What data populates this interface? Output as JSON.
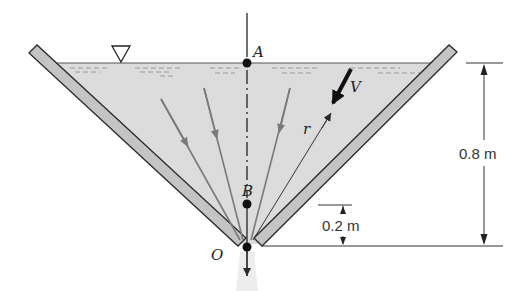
{
  "figure": {
    "type": "conical tank draining through bottom orifice",
    "colors": {
      "water": "#dcdcdc",
      "plate_fill": "#c4c4c4",
      "outline": "#2a2a2a",
      "streamline": "#7a7a7a",
      "jet": "#ececec"
    },
    "points": [
      {
        "label": "A",
        "description": "free surface on centerline"
      },
      {
        "label": "B",
        "description": "point on centerline 0.2 m above O"
      },
      {
        "label": "O",
        "description": "apex / outlet"
      }
    ],
    "labels": {
      "point_a": "A",
      "point_b": "B",
      "point_o": "O",
      "velocity": "V",
      "radius": "r"
    },
    "dimensions": {
      "total_depth": "0.8 m",
      "point_b_height": "0.2 m"
    },
    "symbols": {
      "free_surface": "inverted-triangle"
    }
  }
}
